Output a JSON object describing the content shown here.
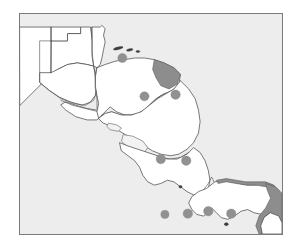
{
  "figure": {
    "caption": "",
    "width_px": 300,
    "height_px": 251
  },
  "map": {
    "region_name": "Central America",
    "projection_note": "",
    "frame": {
      "left": 19,
      "top": 13,
      "width": 264,
      "height": 222,
      "border_color": "#7a7a7a"
    },
    "colors": {
      "ocean": "#ededed",
      "land": "#ffffff",
      "coastline": "#4a4a4a",
      "country_border": "#5a5a5a",
      "shaded_region": "#8d8d8d",
      "site_marker": "#919191",
      "island": "#3d3d3d",
      "lake": "#f2f2f2"
    }
  },
  "countries": [
    {
      "id": "mexico",
      "label": "Mexico"
    },
    {
      "id": "belize",
      "label": "Belize"
    },
    {
      "id": "guatemala",
      "label": "Guatemala"
    },
    {
      "id": "el-salvador",
      "label": "El Salvador"
    },
    {
      "id": "honduras",
      "label": "Honduras"
    },
    {
      "id": "nicaragua",
      "label": "Nicaragua"
    },
    {
      "id": "costa-rica",
      "label": "Costa Rica"
    },
    {
      "id": "panama",
      "label": "Panama"
    },
    {
      "id": "colombia",
      "label": "Colombia"
    }
  ],
  "shaded_regions": [
    {
      "id": "mosquitia",
      "label": "Mosquitia",
      "country": "Honduras",
      "color": "#8d8d8d"
    },
    {
      "id": "darien",
      "label": "Darien",
      "country": "Panama",
      "color": "#8d8d8d"
    },
    {
      "id": "caribbean-panama-coast",
      "label": "Caribbean Panama coast",
      "country": "Panama",
      "color": "#8d8d8d"
    }
  ],
  "water_bodies": [
    {
      "id": "lake-nicaragua",
      "label": "Lake Nicaragua"
    },
    {
      "id": "lake-managua",
      "label": "Lake Managua"
    }
  ],
  "islands": [
    {
      "id": "bay-islands",
      "label": "Bay Islands"
    }
  ],
  "site_markers": [
    {
      "id": "site-1",
      "label": "Honduras north coast",
      "cx": 125,
      "cy": 54,
      "r": 5.6
    },
    {
      "id": "site-2",
      "label": "Honduras central",
      "cx": 152,
      "cy": 101,
      "r": 5.6
    },
    {
      "id": "site-3",
      "label": "Nicaragua north",
      "cx": 190,
      "cy": 99,
      "r": 5.8
    },
    {
      "id": "site-4",
      "label": "Costa Rica northwest",
      "cx": 172,
      "cy": 178,
      "r": 5.8
    },
    {
      "id": "site-5",
      "label": "Costa Rica central",
      "cx": 203,
      "cy": 180,
      "r": 5.8
    },
    {
      "id": "site-6",
      "label": "Panama west",
      "cx": 205,
      "cy": 245,
      "r": 5.8
    },
    {
      "id": "site-7",
      "label": "Panama central",
      "cx": 230,
      "cy": 242,
      "r": 5.8
    },
    {
      "id": "site-8",
      "label": "Panama canal zone",
      "cx": 258,
      "cy": 245,
      "r": 5.8
    },
    {
      "id": "site-9",
      "label": "Panama east",
      "cx": 177,
      "cy": 246,
      "r": 5.0
    }
  ],
  "legend": {
    "visible": false,
    "items": []
  },
  "chart_data": {
    "type": "map",
    "marker_count": 9,
    "shaded_region_count": 3,
    "countries_shown": [
      "Mexico",
      "Belize",
      "Guatemala",
      "El Salvador",
      "Honduras",
      "Nicaragua",
      "Costa Rica",
      "Panama",
      "Colombia"
    ]
  }
}
